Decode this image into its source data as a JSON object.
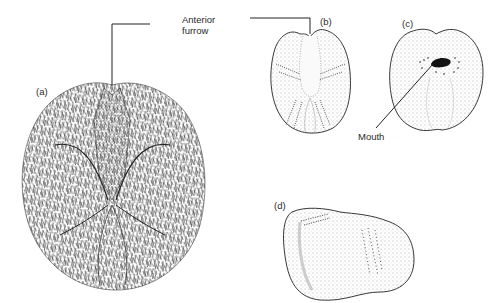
{
  "figure": {
    "annotations": {
      "anterior_furrow": [
        "Anterior",
        "furrow"
      ],
      "mouth": "Mouth"
    },
    "panels": [
      {
        "id": "a",
        "label": "(a)",
        "description": "Spined test, aboral view"
      },
      {
        "id": "b",
        "label": "(b)",
        "description": "Denuded test, aboral view with petals"
      },
      {
        "id": "c",
        "label": "(c)",
        "description": "Oral view showing mouth"
      },
      {
        "id": "d",
        "label": "(d)",
        "description": "Lateral view"
      }
    ],
    "colors": {
      "ink": "#222222",
      "background": "#ffffff",
      "stipple": "#555555"
    }
  }
}
